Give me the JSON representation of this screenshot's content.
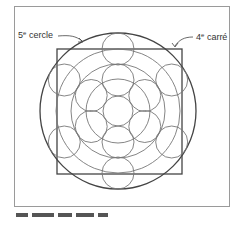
{
  "labels": {
    "circle": {
      "ordinal": "5",
      "suffix": "e",
      "word": "cercle"
    },
    "square": {
      "ordinal": "4",
      "suffix": "e",
      "word": "carré"
    }
  },
  "colors": {
    "frame": "#9a9a9a",
    "outer_shapes": "#444444",
    "inner_shapes": "#777777"
  },
  "geometry": {
    "center": [
      118,
      111
    ],
    "outer_circle_radius": 78,
    "square": {
      "x": 57,
      "y": 49,
      "size": 125
    },
    "concentric_radii": [
      62,
      47,
      32
    ],
    "center_circle_radius": 15,
    "ring_circles": [
      {
        "ring_radius": 62,
        "radius": 16,
        "count": 6
      },
      {
        "ring_radius": 31,
        "radius": 16,
        "count": 6
      }
    ]
  },
  "caption": {
    "visible": "clipped"
  }
}
